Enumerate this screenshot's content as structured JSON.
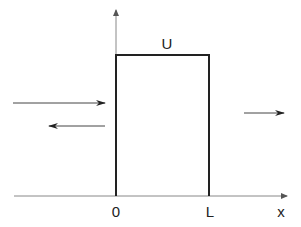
{
  "diagram": {
    "type": "rectangular-potential-barrier",
    "labels": {
      "barrier_height": "U",
      "origin": "0",
      "barrier_width": "L",
      "x_axis": "x"
    },
    "arrows": [
      {
        "name": "incident-wave",
        "direction": "right"
      },
      {
        "name": "reflected-wave",
        "direction": "left"
      },
      {
        "name": "transmitted-wave",
        "direction": "right"
      }
    ],
    "colors": {
      "axis": "#777777",
      "barrier": "#222222",
      "arrow": "#333333"
    }
  }
}
